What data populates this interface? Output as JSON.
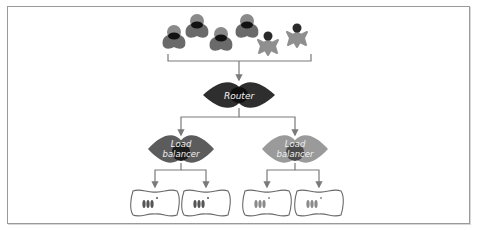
{
  "diagram": {
    "title": "",
    "clients": [
      {
        "type": "user",
        "shade": "dark"
      },
      {
        "type": "user",
        "shade": "dark"
      },
      {
        "type": "user",
        "shade": "dark"
      },
      {
        "type": "user",
        "shade": "dark"
      },
      {
        "type": "mobile-user",
        "shade": "light"
      },
      {
        "type": "mobile-user",
        "shade": "light"
      }
    ],
    "router": {
      "label": "Router",
      "color": "#2e2e2e",
      "core": "#0f0f0f"
    },
    "load_balancers": [
      {
        "label_line1": "Load",
        "label_line2": "balancer",
        "color": "#5c5c5c",
        "core": "#1c1c1c",
        "servers": 2,
        "server_shade": "#555555"
      },
      {
        "label_line1": "Load",
        "label_line2": "balancer",
        "color": "#9a9a9a",
        "core": "#4a4a4a",
        "servers": 2,
        "server_shade": "#8a8a8a"
      }
    ],
    "colors": {
      "line": "#7a7a7a",
      "user_body": "#6a6a6a",
      "user_head": "#8a8a8a",
      "user_face": "#111111",
      "mobile_body": "#8f8f8f",
      "mobile_head": "#2a2a2a",
      "server_outline": "#6a6a6a"
    }
  }
}
